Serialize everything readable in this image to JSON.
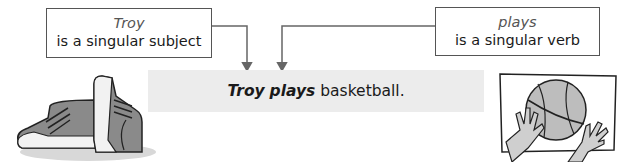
{
  "diagram": {
    "left_label": {
      "term": "Troy",
      "description": "is a singular subject"
    },
    "right_label": {
      "term": "plays",
      "description": "is a singular verb"
    },
    "sentence": {
      "subject": "Troy",
      "verb": "plays",
      "rest": "basketball."
    },
    "illustrations": {
      "left": "sneakers-icon",
      "right": "basketball-hands-icon"
    },
    "colors": {
      "box_border": "#555555",
      "term_text": "#555555",
      "sentence_bg": "#ececec",
      "arrow": "#666666"
    }
  }
}
